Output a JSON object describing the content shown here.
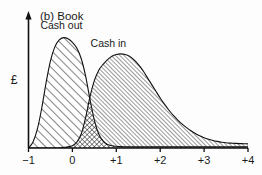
{
  "figure": {
    "panel_label": "(b)",
    "panel_title": "Book",
    "panel_title_full": "(b)  Book",
    "background_color": "#fdfdfd",
    "ink_color": "#111111"
  },
  "chart_data": {
    "type": "area",
    "title": "(b)  Book",
    "xlabel": "",
    "ylabel": "£",
    "xlim": [
      -1,
      4
    ],
    "ylim": [
      0,
      1.05
    ],
    "grid": false,
    "legend": "inline-annotations",
    "xticks": [
      -1,
      0,
      1,
      2,
      3,
      4
    ],
    "xticklabels": [
      "−1",
      "0",
      "+1",
      "+2",
      "+3",
      "+4"
    ],
    "yticks": [],
    "yticklabels": [],
    "x": [
      -1.0,
      -0.9,
      -0.8,
      -0.7,
      -0.6,
      -0.5,
      -0.4,
      -0.3,
      -0.2,
      -0.1,
      0.0,
      0.1,
      0.2,
      0.3,
      0.4,
      0.5,
      0.6,
      0.7,
      0.8,
      0.9,
      1.0,
      1.1,
      1.2,
      1.3,
      1.4,
      1.5,
      1.6,
      1.7,
      1.8,
      1.9,
      2.0,
      2.1,
      2.2,
      2.3,
      2.4,
      2.5,
      2.6,
      2.7,
      2.8,
      2.9,
      3.0,
      3.1,
      3.2,
      3.3,
      3.4,
      3.5,
      3.6,
      3.7,
      3.8,
      3.9,
      4.0
    ],
    "series": [
      {
        "name": "Cash out",
        "label": "Cash out",
        "fill_pattern": "diagonal-hatch-coarse",
        "values": [
          0.0,
          0.05,
          0.16,
          0.34,
          0.56,
          0.75,
          0.87,
          0.93,
          0.95,
          0.94,
          0.91,
          0.86,
          0.77,
          0.62,
          0.42,
          0.24,
          0.12,
          0.06,
          0.03,
          0.02,
          0.015,
          0.012,
          0.01,
          0.01,
          0.01,
          0.01,
          0.01,
          0.01,
          0.01,
          0.01,
          0.01,
          0.01,
          0.01,
          0.01,
          0.01,
          0.01,
          0.01,
          0.01,
          0.01,
          0.01,
          0.01,
          0.01,
          0.01,
          0.01,
          0.01,
          0.01,
          0.01,
          0.01,
          0.01,
          0.01,
          0.01
        ]
      },
      {
        "name": "Cash in",
        "label": "Cash in",
        "fill_pattern": "diagonal-hatch-fine",
        "values": [
          0.0,
          0.0,
          0.0,
          0.0,
          0.0,
          0.0,
          0.0,
          0.0,
          0.005,
          0.01,
          0.02,
          0.05,
          0.12,
          0.26,
          0.44,
          0.58,
          0.67,
          0.72,
          0.76,
          0.79,
          0.805,
          0.81,
          0.805,
          0.79,
          0.76,
          0.72,
          0.67,
          0.61,
          0.55,
          0.49,
          0.43,
          0.375,
          0.325,
          0.28,
          0.24,
          0.205,
          0.175,
          0.148,
          0.125,
          0.105,
          0.088,
          0.075,
          0.065,
          0.057,
          0.05,
          0.045,
          0.042,
          0.04,
          0.038,
          0.037,
          0.036
        ]
      }
    ],
    "annotations": [
      {
        "text": "Cash out",
        "x": -0.25,
        "y": 1.02
      },
      {
        "text": "Cash in",
        "x": 0.82,
        "y": 0.87
      }
    ],
    "overlap_region": {
      "description": "cross-hatched area where Cash in and Cash out overlap",
      "pattern": "cross-hatch"
    }
  }
}
